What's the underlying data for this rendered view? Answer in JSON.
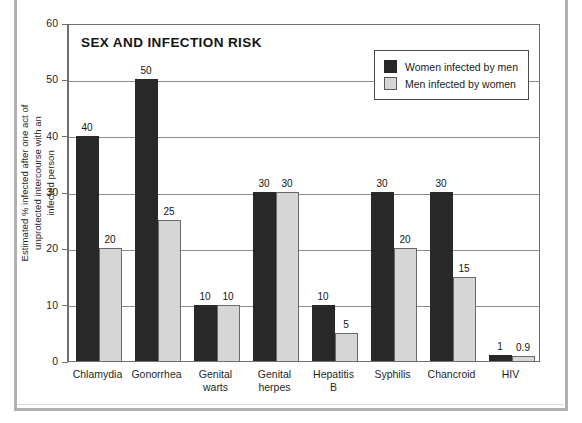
{
  "figure": {
    "frame_color": "#b0b0b0",
    "background": "#ffffff"
  },
  "chart_data": {
    "type": "bar",
    "title": "SEX AND INFECTION RISK",
    "xlabel": "",
    "ylabel": "Estimated % infected after one act of unprotected intercourse with an infected person",
    "ylim": [
      0,
      60
    ],
    "yticks": [
      0,
      10,
      20,
      30,
      40,
      50,
      60
    ],
    "grid": true,
    "legend_position": "top-right",
    "categories": [
      "Chlamydia",
      "Gonorrhea",
      "Genital warts",
      "Genital herpes",
      "Hepatitis B",
      "Syphilis",
      "Chancroid",
      "HIV"
    ],
    "category_lines": [
      [
        "Chlamydia"
      ],
      [
        "Gonorrhea"
      ],
      [
        "Genital",
        "warts"
      ],
      [
        "Genital",
        "herpes"
      ],
      [
        "Hepatitis",
        "B"
      ],
      [
        "Syphilis"
      ],
      [
        "Chancroid"
      ],
      [
        "HIV"
      ]
    ],
    "series": [
      {
        "name": "Women infected by men",
        "color": "#282828",
        "values": [
          40,
          50,
          10,
          30,
          10,
          30,
          30,
          1
        ],
        "labels": [
          "40",
          "50",
          "10",
          "30",
          "10",
          "30",
          "30",
          "1"
        ]
      },
      {
        "name": "Men infected by women",
        "color": "#d6d6d6",
        "values": [
          20,
          25,
          10,
          30,
          5,
          20,
          15,
          0.9
        ],
        "labels": [
          "20",
          "25",
          "10",
          "30",
          "5",
          "20",
          "15",
          "0.9"
        ]
      }
    ]
  },
  "legend": {
    "entries": [
      {
        "label": "Women infected by men",
        "color": "#282828"
      },
      {
        "label": "Men infected by women",
        "color": "#d6d6d6"
      }
    ]
  },
  "yaxis": {
    "ticks": [
      "0",
      "10",
      "20",
      "30",
      "40",
      "50",
      "60"
    ],
    "title": "Estimated % infected after one act of unprotected intercourse with an infected person"
  }
}
